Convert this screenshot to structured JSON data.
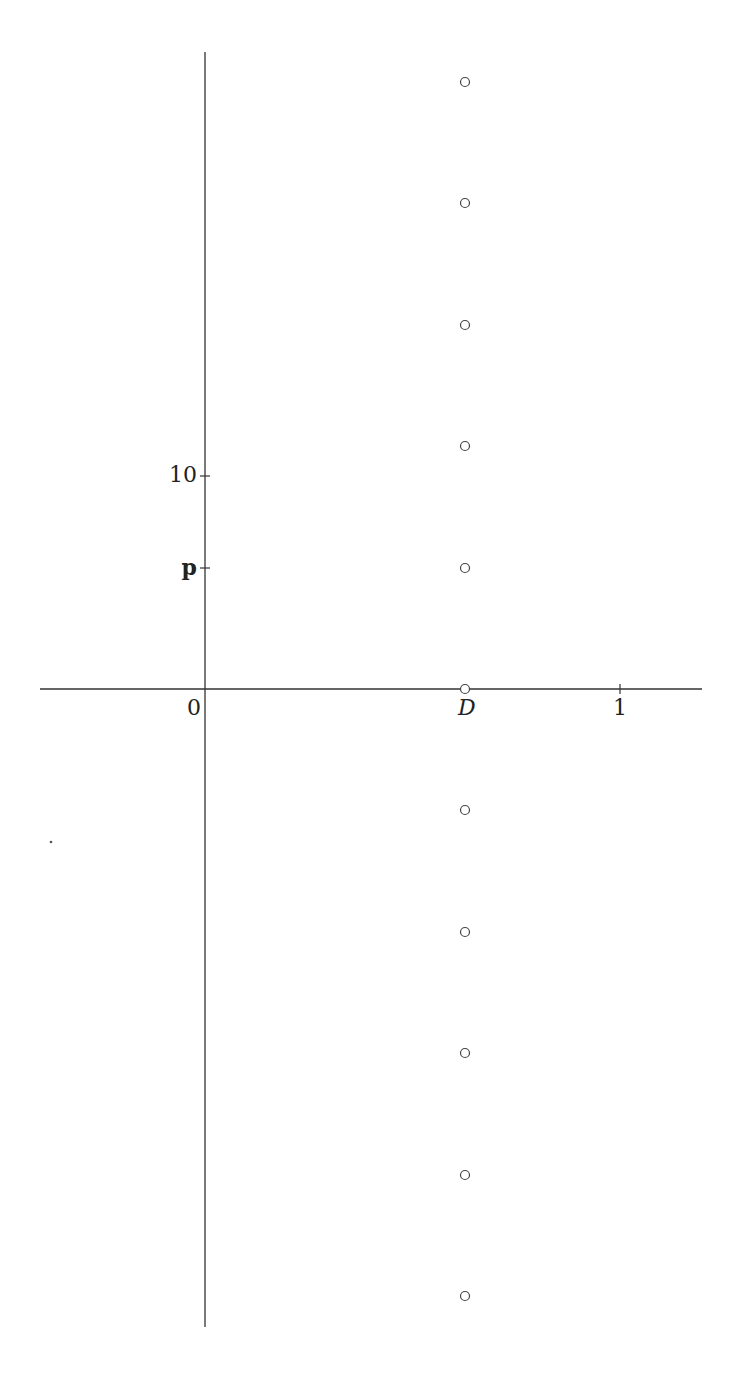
{
  "diagram": {
    "type": "number-line-plot",
    "axes": {
      "x_axis": {
        "x1": 40,
        "x2": 702,
        "y": 689
      },
      "y_axis": {
        "x": 205,
        "y1": 52,
        "y2": 1327
      },
      "stroke": "#333333"
    },
    "x_ticks": [
      {
        "label": "0",
        "x": 205,
        "tick": false,
        "italic": false
      },
      {
        "label": "D",
        "x": 465,
        "tick": false,
        "italic": true
      },
      {
        "label": "1",
        "x": 620,
        "tick": true,
        "italic": false
      }
    ],
    "y_ticks": [
      {
        "label": "10",
        "y": 476,
        "bold": false
      },
      {
        "label": "p",
        "y": 568,
        "bold": true
      }
    ],
    "points": {
      "x": 465,
      "y": [
        82,
        203,
        325,
        446,
        568,
        689,
        810,
        932,
        1053,
        1175,
        1296
      ],
      "radius": 4.5,
      "stroke": "#444444",
      "fill": "none"
    },
    "stray_dot": {
      "x": 51,
      "y": 842
    }
  }
}
